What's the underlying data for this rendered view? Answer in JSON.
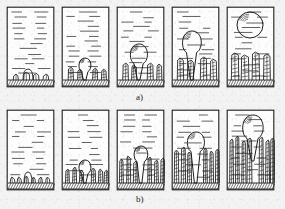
{
  "figure": {
    "background_color": "#f3f3f3",
    "ink_color": "#1c1c1c",
    "panel_count_per_row": 5,
    "rows": [
      {
        "id": "a",
        "label": "a)",
        "description": "Row a: sparse, widely spaced dendrites; bubble nucleates at substrate and detaches at final stage",
        "panels": [
          {
            "index": 1,
            "name": "panel-a1",
            "stage_caption": "stage 1",
            "bubble_state": "none",
            "bubble_cx": 0,
            "bubble_cy": 0,
            "bubble_r": 0,
            "dendrites": [
              {
                "x": 7,
                "h": 6,
                "w": 6,
                "spikes": 0
              },
              {
                "x": 17,
                "h": 8,
                "w": 7,
                "spikes": 0
              },
              {
                "x": 27,
                "h": 7,
                "w": 6,
                "spikes": 0
              },
              {
                "x": 37,
                "h": 6,
                "w": 6,
                "spikes": 0
              }
            ],
            "nucleus": {
              "cx": 22,
              "cy": 68,
              "rx": 5,
              "ry": 5
            }
          },
          {
            "index": 2,
            "name": "panel-a2",
            "stage_caption": "stage 2",
            "bubble_state": "attached-small",
            "bubble_cx": 24,
            "bubble_cy": 59,
            "bubble_r": 7,
            "dendrites": [
              {
                "x": 7,
                "h": 13,
                "w": 6,
                "spikes": 3
              },
              {
                "x": 16,
                "h": 11,
                "w": 6,
                "spikes": 3
              },
              {
                "x": 31,
                "h": 12,
                "w": 6,
                "spikes": 3
              },
              {
                "x": 40,
                "h": 11,
                "w": 6,
                "spikes": 3
              }
            ],
            "nucleus": null
          },
          {
            "index": 3,
            "name": "panel-a3",
            "stage_caption": "stage 3",
            "bubble_state": "attached-medium",
            "bubble_cx": 23,
            "bubble_cy": 48,
            "bubble_r": 10,
            "dendrites": [
              {
                "x": 6,
                "h": 17,
                "w": 7,
                "spikes": 4
              },
              {
                "x": 15,
                "h": 15,
                "w": 6,
                "spikes": 4
              },
              {
                "x": 31,
                "h": 17,
                "w": 7,
                "spikes": 4
              },
              {
                "x": 40,
                "h": 16,
                "w": 6,
                "spikes": 4
              }
            ],
            "nucleus": null
          },
          {
            "index": 4,
            "name": "panel-a4",
            "stage_caption": "stage 4",
            "bubble_state": "attached-large",
            "bubble_cx": 21,
            "bubble_cy": 36,
            "bubble_r": 11,
            "dendrites": [
              {
                "x": 6,
                "h": 22,
                "w": 7,
                "spikes": 5
              },
              {
                "x": 16,
                "h": 20,
                "w": 7,
                "spikes": 5
              },
              {
                "x": 29,
                "h": 23,
                "w": 7,
                "spikes": 5
              },
              {
                "x": 39,
                "h": 21,
                "w": 7,
                "spikes": 5
              }
            ],
            "nucleus": null
          },
          {
            "index": 5,
            "name": "panel-a5",
            "stage_caption": "stage 5",
            "bubble_state": "detached-floating",
            "bubble_cx": 24,
            "bubble_cy": 19,
            "bubble_r": 13,
            "dendrites": [
              {
                "x": 5,
                "h": 27,
                "w": 8,
                "spikes": 6
              },
              {
                "x": 15,
                "h": 25,
                "w": 8,
                "spikes": 6
              },
              {
                "x": 26,
                "h": 28,
                "w": 8,
                "spikes": 6
              },
              {
                "x": 37,
                "h": 26,
                "w": 8,
                "spikes": 6
              }
            ],
            "nucleus": null
          }
        ]
      },
      {
        "id": "b",
        "label": "b)",
        "description": "Row b: dense, closely packed dendrites; bubble is confined and elongated between dendrite columns",
        "panels": [
          {
            "index": 1,
            "name": "panel-b1",
            "stage_caption": "stage 1",
            "bubble_state": "none",
            "bubble_cx": 0,
            "bubble_cy": 0,
            "bubble_r": 0,
            "dendrites": [
              {
                "x": 4,
                "h": 6,
                "w": 5,
                "spikes": 0
              },
              {
                "x": 11,
                "h": 6,
                "w": 5,
                "spikes": 0
              },
              {
                "x": 18,
                "h": 7,
                "w": 5,
                "spikes": 0
              },
              {
                "x": 25,
                "h": 6,
                "w": 5,
                "spikes": 0
              },
              {
                "x": 32,
                "h": 6,
                "w": 5,
                "spikes": 0
              },
              {
                "x": 39,
                "h": 6,
                "w": 5,
                "spikes": 0
              }
            ],
            "nucleus": {
              "cx": 22,
              "cy": 68,
              "rx": 4,
              "ry": 5
            }
          },
          {
            "index": 2,
            "name": "panel-b2",
            "stage_caption": "stage 2",
            "bubble_state": "attached-small",
            "bubble_cx": 24,
            "bubble_cy": 58,
            "bubble_r": 7,
            "dendrites": [
              {
                "x": 4,
                "h": 14,
                "w": 5,
                "spikes": 4
              },
              {
                "x": 11,
                "h": 16,
                "w": 5,
                "spikes": 4
              },
              {
                "x": 18,
                "h": 13,
                "w": 5,
                "spikes": 4
              },
              {
                "x": 30,
                "h": 15,
                "w": 5,
                "spikes": 4
              },
              {
                "x": 37,
                "h": 14,
                "w": 5,
                "spikes": 4
              },
              {
                "x": 43,
                "h": 13,
                "w": 5,
                "spikes": 4
              }
            ],
            "nucleus": null
          },
          {
            "index": 3,
            "name": "panel-b3",
            "stage_caption": "stage 3",
            "bubble_state": "attached-medium",
            "bubble_cx": 25,
            "bubble_cy": 45,
            "bubble_r": 8,
            "dendrites": [
              {
                "x": 3,
                "h": 24,
                "w": 5,
                "spikes": 6
              },
              {
                "x": 10,
                "h": 27,
                "w": 5,
                "spikes": 6
              },
              {
                "x": 17,
                "h": 22,
                "w": 5,
                "spikes": 6
              },
              {
                "x": 31,
                "h": 26,
                "w": 5,
                "spikes": 6
              },
              {
                "x": 38,
                "h": 23,
                "w": 5,
                "spikes": 6
              },
              {
                "x": 44,
                "h": 25,
                "w": 5,
                "spikes": 6
              }
            ],
            "nucleus": null
          },
          {
            "index": 4,
            "name": "panel-b4",
            "stage_caption": "stage 4",
            "bubble_state": "attached-elongated",
            "bubble_cx": 25,
            "bubble_cy": 33,
            "bubble_r": 10,
            "dendrites": [
              {
                "x": 3,
                "h": 33,
                "w": 5,
                "spikes": 8
              },
              {
                "x": 10,
                "h": 36,
                "w": 5,
                "spikes": 8
              },
              {
                "x": 16,
                "h": 31,
                "w": 5,
                "spikes": 8
              },
              {
                "x": 32,
                "h": 35,
                "w": 5,
                "spikes": 8
              },
              {
                "x": 38,
                "h": 32,
                "w": 5,
                "spikes": 8
              },
              {
                "x": 44,
                "h": 34,
                "w": 5,
                "spikes": 8
              }
            ],
            "nucleus": null
          },
          {
            "index": 5,
            "name": "panel-b5",
            "stage_caption": "stage 5",
            "bubble_state": "emerging-top",
            "bubble_cx": 27,
            "bubble_cy": 18,
            "bubble_r": 12,
            "dendrites": [
              {
                "x": 3,
                "h": 44,
                "w": 5,
                "spikes": 10
              },
              {
                "x": 9,
                "h": 47,
                "w": 5,
                "spikes": 10
              },
              {
                "x": 15,
                "h": 42,
                "w": 5,
                "spikes": 10
              },
              {
                "x": 21,
                "h": 45,
                "w": 5,
                "spikes": 10
              },
              {
                "x": 33,
                "h": 46,
                "w": 5,
                "spikes": 10
              },
              {
                "x": 39,
                "h": 43,
                "w": 5,
                "spikes": 10
              },
              {
                "x": 44,
                "h": 45,
                "w": 5,
                "spikes": 10
              }
            ],
            "nucleus": null
          }
        ]
      }
    ],
    "legend_elements": {
      "melt_hatch": "horizontal dashed lines representing liquid melt",
      "substrate_hatch": "diagonal hatching band representing solid substrate",
      "bubble_arcs": "short arc strokes inside bubble representing highlight"
    }
  }
}
